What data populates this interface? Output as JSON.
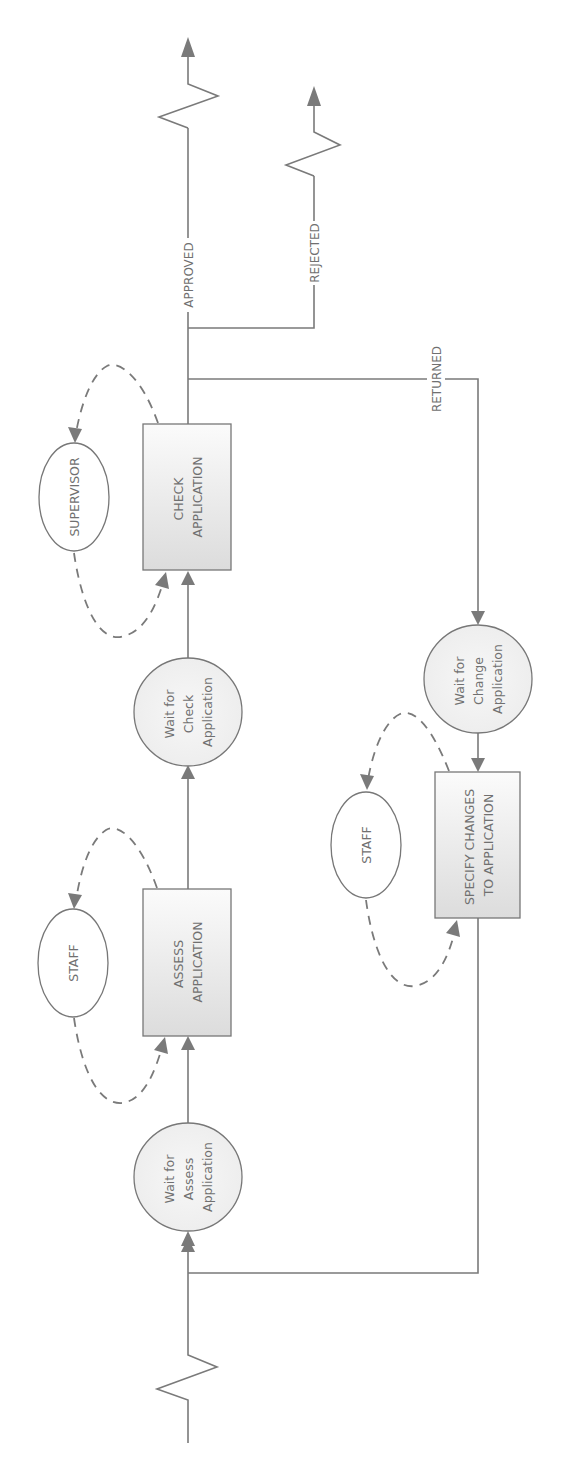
{
  "diagram": {
    "type": "workflow-petri-net",
    "orientation": "rotated-90-ccw",
    "colors": {
      "line": "#7a7a7a",
      "text": "#707070",
      "task_fill_light": "#fbfbfb",
      "task_fill_dark": "#dcdcdc",
      "condition_fill": "#f1f1f1",
      "resource_fill": "#ffffff"
    },
    "conditions": [
      {
        "id": "wait-assess",
        "lines": [
          "Wait for",
          "Assess",
          "Application"
        ]
      },
      {
        "id": "wait-check",
        "lines": [
          "Wait for",
          "Check",
          "Application"
        ]
      },
      {
        "id": "wait-change",
        "lines": [
          "Wait for",
          "Change",
          "Application"
        ]
      }
    ],
    "tasks": [
      {
        "id": "assess",
        "lines": [
          "ASSESS",
          "APPLICATION"
        ]
      },
      {
        "id": "check",
        "lines": [
          "CHECK",
          "APPLICATION"
        ]
      },
      {
        "id": "specify",
        "lines": [
          "SPECIFY CHANGES",
          "TO APPLICATION"
        ]
      }
    ],
    "resources": [
      {
        "id": "staff-assess",
        "label": "STAFF",
        "attached_to": "assess"
      },
      {
        "id": "supervisor-check",
        "label": "SUPERVISOR",
        "attached_to": "check"
      },
      {
        "id": "staff-specify",
        "label": "STAFF",
        "attached_to": "specify"
      }
    ],
    "outcomes": [
      {
        "id": "approved",
        "label": "APPROVED"
      },
      {
        "id": "rejected",
        "label": "REJECTED"
      },
      {
        "id": "returned",
        "label": "RETURNED"
      }
    ]
  }
}
